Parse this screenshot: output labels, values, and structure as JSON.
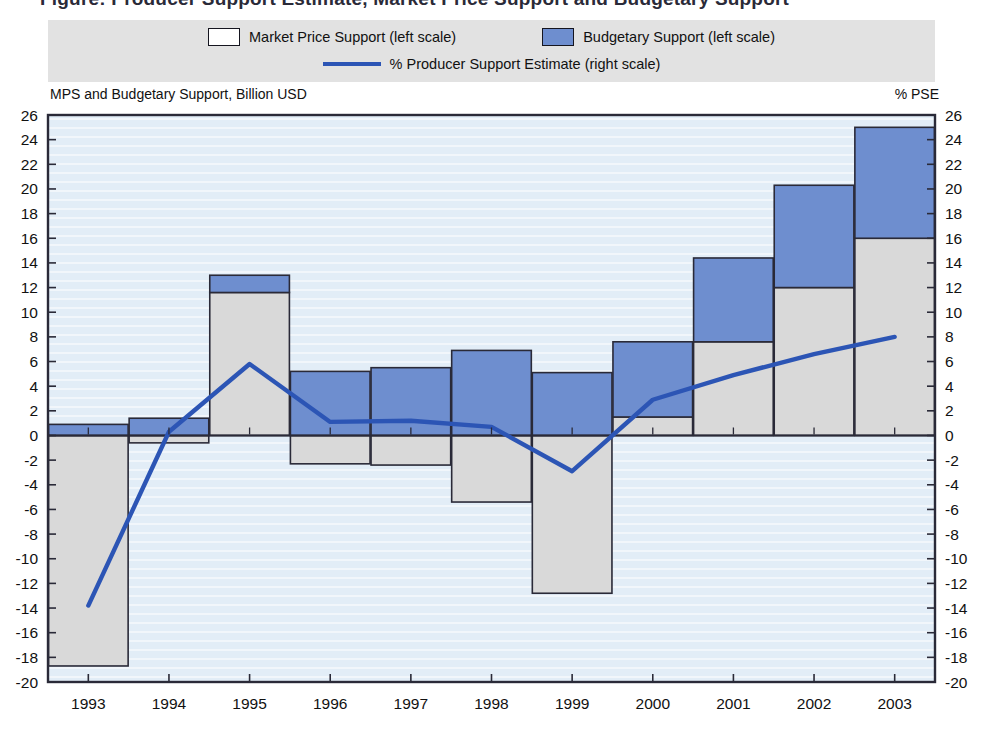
{
  "figure": {
    "cutoff_title": "Figure: Producer Support Estimate, Market Price Support and Budgetary Support"
  },
  "legend": {
    "mps": "Market Price Support (left scale)",
    "budgetary": "Budgetary Support (left scale)",
    "pse_line": "% Producer Support Estimate (right scale)"
  },
  "axis_titles": {
    "left": "MPS and Budgetary Support, Billion USD",
    "right": "% PSE"
  },
  "colors": {
    "budgetary_fill": "#6e8ecf",
    "mps_fill": "#d9d9d9",
    "line": "#2c55b5",
    "plot_background": "#e2edf7",
    "legend_background": "#e2e2e2",
    "outline": "#2a2a38"
  },
  "chart_data": {
    "type": "bar",
    "title": "",
    "subtitle": "",
    "xlabel": "",
    "ylabel": "MPS and Budgetary Support, Billion USD",
    "y2label": "% PSE",
    "ylim": [
      -20,
      26
    ],
    "y2lim": [
      -20,
      26
    ],
    "ytick_step": 2,
    "grid": false,
    "legend_position": "top",
    "categories": [
      "1993",
      "1994",
      "1995",
      "1996",
      "1997",
      "1998",
      "1999",
      "2000",
      "2001",
      "2002",
      "2003"
    ],
    "yticks": [
      26,
      24,
      22,
      20,
      18,
      16,
      14,
      12,
      10,
      8,
      6,
      4,
      2,
      0,
      -2,
      -4,
      -6,
      -8,
      -10,
      -12,
      -14,
      -16,
      -18,
      -20
    ],
    "ytick_labels": [
      "26",
      "24",
      "22",
      "20",
      "18",
      "16",
      "14",
      "12",
      "10",
      "8",
      "6",
      "4",
      "2",
      "0",
      "-2",
      "-4",
      "-6",
      "-8",
      "-10",
      "-12",
      "-14",
      "-16",
      "-18",
      "-20"
    ],
    "series": [
      {
        "name": "Market Price Support (left scale)",
        "type": "bar",
        "stack": "support",
        "axis": "left",
        "color": "#d9d9d9",
        "values": [
          -18.7,
          -0.6,
          11.6,
          -2.3,
          -2.4,
          -5.4,
          -12.8,
          1.5,
          7.6,
          12.0,
          16.0
        ]
      },
      {
        "name": "Budgetary Support (left scale)",
        "type": "bar",
        "stack": "support",
        "axis": "left",
        "color": "#6e8ecf",
        "values": [
          0.9,
          1.4,
          1.4,
          5.2,
          5.5,
          6.9,
          5.1,
          6.1,
          6.8,
          8.3,
          9.0
        ]
      },
      {
        "name": "% Producer Support Estimate (right scale)",
        "type": "line",
        "axis": "right",
        "color": "#2c55b5",
        "values": [
          -13.8,
          0.3,
          5.8,
          1.1,
          1.2,
          0.7,
          -2.9,
          2.9,
          4.9,
          6.6,
          8.0
        ]
      }
    ]
  }
}
